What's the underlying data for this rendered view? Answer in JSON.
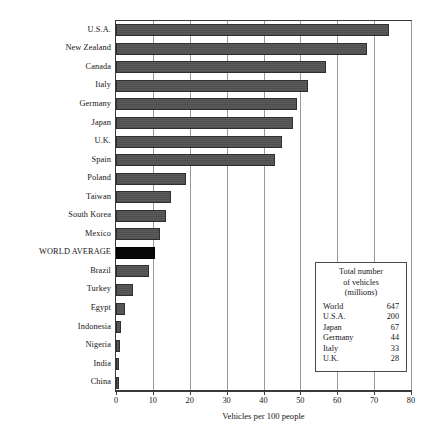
{
  "chart_data": {
    "type": "bar",
    "orientation": "horizontal",
    "title": "",
    "xlabel": "Vehicles per 100 people",
    "ylabel": "",
    "xlim": [
      0,
      80
    ],
    "xticks": [
      0,
      10,
      20,
      30,
      40,
      50,
      60,
      70,
      80
    ],
    "grid": true,
    "legend_position": "inside-lower-right",
    "categories": [
      "U.S.A.",
      "New Zealand",
      "Canada",
      "Italy",
      "Germany",
      "Japan",
      "U.K.",
      "Spain",
      "Poland",
      "Taiwan",
      "South Korea",
      "Mexico",
      "WORLD AVERAGE",
      "Brazil",
      "Turkey",
      "Egypt",
      "Indonesia",
      "Nigeria",
      "India",
      "China"
    ],
    "values": [
      74,
      68,
      57,
      52,
      49,
      48,
      45,
      43,
      19,
      15,
      13.5,
      12,
      10.5,
      9,
      4.5,
      2.5,
      1.3,
      1.2,
      0.7,
      0.6
    ],
    "highlight_category": "WORLD AVERAGE",
    "colors": {
      "bar": "#555555",
      "bar_highlight": "#000000",
      "frame": "#3a3a3a",
      "gridline": "#9a9a9a"
    }
  },
  "legend": {
    "title_lines": [
      "Total number",
      "of vehicles",
      "(millions)"
    ],
    "rows": [
      {
        "name": "World",
        "value": "647"
      },
      {
        "name": "U.S.A.",
        "value": "200"
      },
      {
        "name": "Japan",
        "value": "67"
      },
      {
        "name": "Germany",
        "value": "44"
      },
      {
        "name": "Italy",
        "value": "33"
      },
      {
        "name": "U.K.",
        "value": "28"
      }
    ]
  }
}
